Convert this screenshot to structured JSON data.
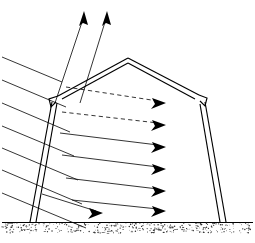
{
  "figure": {
    "title": "Solar radiation on a barn cross-section",
    "style": "black-and-white technical line drawing",
    "background_color": "#ffffff",
    "line_color": "#000000"
  },
  "canvas": {
    "width": 255,
    "height": 243
  },
  "building": {
    "name": "barn",
    "roof_type": "gable",
    "wall_style": "double-line outline",
    "peak": {
      "x": 128,
      "y": 58
    },
    "left_eave": {
      "x": 58,
      "y": 96
    },
    "right_eave": {
      "x": 198,
      "y": 95
    },
    "left_base": {
      "x": 31,
      "y": 222
    },
    "right_base": {
      "x": 224,
      "y": 222
    },
    "outer_outline_points": "128,58 58,96 31,222",
    "inner_outline_points": "128,62 62,98 36,222",
    "right_outer_points": "128,58 198,95 224,222",
    "right_inner_points": "128,62 194,98 219,222",
    "left_eave_notch_path": "M 58,96 L 50,99 L 52,106 L 56,101 L 62,99",
    "right_eave_notch_path": "M 198,95 L 206,98 L 204,105 L 200,100 L 194,98"
  },
  "ground": {
    "name": "ground-surface",
    "line_y": 222,
    "soil_band_top": 223,
    "soil_band_bottom": 233,
    "texture": "stipple",
    "dot_count": 300
  },
  "chart_data": {
    "type": "diagram",
    "title": "Solar radiation on a barn cross-section",
    "incoming_rays": {
      "label": "Incoming solar radiation",
      "count": 7,
      "direction": "down-right",
      "angle_degrees": 23,
      "entry_y_values": [
        57,
        80,
        103,
        126,
        148,
        170,
        193
      ],
      "entry_x": 2,
      "style": "solid outside, dashed for top two inside building"
    },
    "interior_arrows": {
      "label": "Transmitted radiation arrowheads",
      "count": 6,
      "tip_x_values": [
        163,
        163,
        163,
        163,
        163,
        163
      ],
      "tip_y_values": [
        103,
        125,
        147,
        169,
        191,
        211
      ]
    },
    "ground_arrow": {
      "label": "Radiation reaching floor",
      "count": 1,
      "tip": {
        "x": 100,
        "y": 212
      }
    },
    "reflected_arrows": {
      "label": "Reflected / escaping radiation",
      "count": 2,
      "direction": "up-right",
      "tips": [
        {
          "x": 82,
          "y": 12
        },
        {
          "x": 105,
          "y": 12
        }
      ],
      "origins": [
        {
          "x": 55,
          "y": 102
        },
        {
          "x": 80,
          "y": 102
        }
      ]
    },
    "dashed_rays": {
      "label": "Dashed interior rays",
      "count": 2,
      "indices": [
        0,
        1
      ]
    }
  },
  "legend": {
    "visible": false,
    "entries": []
  },
  "labels": {
    "visible_text": [],
    "note": "The diagram contains no rendered text labels, axis ticks, or captions."
  }
}
